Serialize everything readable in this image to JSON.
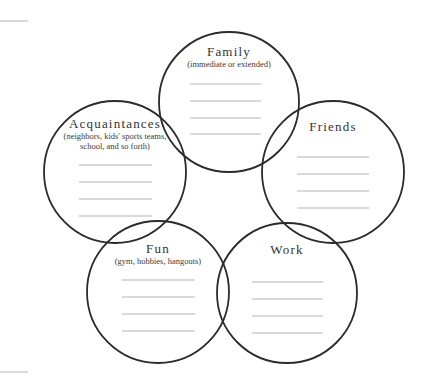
{
  "diagram": {
    "type": "social-circles-worksheet",
    "colors": {
      "circle_stroke": "#2b2b2b",
      "write_line": "#b5b5b5",
      "text": "#333333",
      "background": "#ffffff"
    },
    "circles": [
      {
        "id": "family",
        "title": "Family",
        "subtitle_lines": [
          "(immediate or extended)"
        ],
        "cx": 229,
        "cy": 102,
        "r": 70,
        "title_y": 45,
        "lines_y": [
          84,
          101,
          118,
          134
        ],
        "lines_x": [
          190,
          261
        ]
      },
      {
        "id": "friends",
        "title": "Friends",
        "subtitle_lines": [],
        "cx": 333,
        "cy": 172,
        "r": 71,
        "title_y": 120,
        "lines_y": [
          157,
          174,
          191,
          208
        ],
        "lines_x": [
          297,
          369
        ]
      },
      {
        "id": "acquaintances",
        "title": "Acquaintances",
        "subtitle_lines": [
          "(neighbors, kids' sports teams,",
          "school, and so forth)"
        ],
        "cx": 115,
        "cy": 172,
        "r": 71,
        "title_y": 117,
        "lines_y": [
          165,
          182,
          199,
          216
        ],
        "lines_x": [
          79,
          152
        ]
      },
      {
        "id": "fun",
        "title": "Fun",
        "subtitle_lines": [
          "(gym, hobbies, hangouts)"
        ],
        "cx": 158,
        "cy": 292,
        "r": 71,
        "title_y": 242,
        "lines_y": [
          280,
          297,
          314,
          331
        ],
        "lines_x": [
          122,
          195
        ]
      },
      {
        "id": "work",
        "title": "Work",
        "subtitle_lines": [],
        "cx": 287,
        "cy": 293,
        "r": 70,
        "title_y": 243,
        "lines_y": [
          282,
          299,
          316,
          333
        ],
        "lines_x": [
          252,
          323
        ]
      }
    ],
    "margin_marks": [
      {
        "x1": 0,
        "y1": 21,
        "x2": 28,
        "y2": 21
      },
      {
        "x1": 0,
        "y1": 372,
        "x2": 28,
        "y2": 372
      }
    ]
  }
}
